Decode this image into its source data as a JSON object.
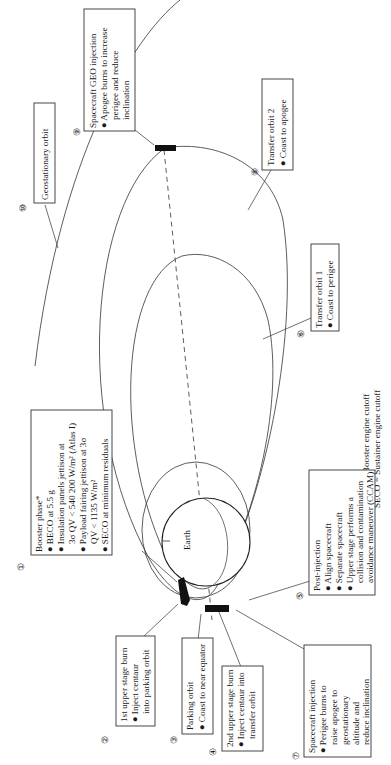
{
  "diagram": {
    "earth_label": "Earth",
    "steps": [
      {
        "num": "1",
        "title": "Booster phase*",
        "bullets": [
          "BECO at 5.5 g",
          "Insulation panels jettison at",
          "3σ QV < 540 200 W/m² (Atlas I)",
          "Payload fairing jettison at 3σ",
          "QV < 1135 W/m²",
          "SECO at minimum residuals"
        ]
      },
      {
        "num": "2",
        "title": "1st upper stage burn",
        "bullets": [
          "Inject centaur",
          "into parking orbit"
        ]
      },
      {
        "num": "3",
        "title": "Parking orbit",
        "bullets": [
          "Coast to near equator"
        ]
      },
      {
        "num": "4",
        "title": "2nd upper stage burn",
        "bullets": [
          "Inject centaur into",
          "transfer orbit"
        ]
      },
      {
        "num": "5",
        "title": "Post-injection",
        "bullets": [
          "Align spacecraft",
          "Separate spacecraft",
          "Upper stage performs a",
          "collision and contamination",
          "avoidance maneuver (CCAM)"
        ]
      },
      {
        "num": "6",
        "title": "Transfer orbit 1",
        "bullets": [
          "Coast to perigee"
        ]
      },
      {
        "num": "7",
        "title": "Spacecraft injection",
        "bullets": [
          "Perigee burns to",
          "raise apogee to",
          "geostationary",
          "altitude and",
          "reduce inclination"
        ]
      },
      {
        "num": "8",
        "title": "Transfer orbit 2",
        "bullets": [
          "Coast to apogee"
        ]
      },
      {
        "num": "9",
        "title": "Spacecraft GEO injection",
        "bullets": [
          "Apogee burns to increase",
          "perigee and reduce",
          "inclination"
        ]
      },
      {
        "num": "10",
        "title": "Geostationary orbit",
        "bullets": []
      }
    ],
    "footnote": [
      "*BECO = Booster engine cutoff",
      "SECO = Sustainer engine cutoff"
    ]
  }
}
